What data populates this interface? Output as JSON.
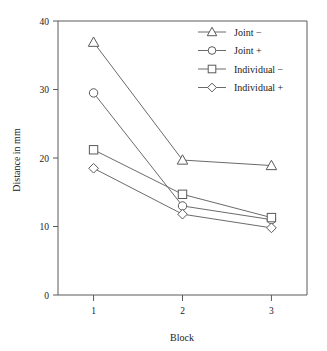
{
  "chart_data": {
    "type": "line",
    "title": "",
    "subtitle": "",
    "xlabel": "Block",
    "ylabel": "Distance in mm",
    "categories": [
      "1",
      "2",
      "3"
    ],
    "x": [
      1,
      2,
      3
    ],
    "xlim": [
      0.6,
      3.4
    ],
    "ylim": [
      0,
      40
    ],
    "yticks": [
      0,
      10,
      20,
      30,
      40
    ],
    "ytick_labels": [
      "0",
      "10",
      "20",
      "30",
      "40"
    ],
    "xticks": [
      1,
      2,
      3
    ],
    "xtick_labels": [
      "1",
      "2",
      "3"
    ],
    "grid": false,
    "legend_position": "top-right",
    "series": [
      {
        "name": "Joint −",
        "marker": "triangle",
        "values": [
          36.9,
          19.7,
          18.9
        ]
      },
      {
        "name": "Joint +",
        "marker": "circle",
        "values": [
          29.5,
          13.0,
          11.0
        ]
      },
      {
        "name": "Individual −",
        "marker": "square",
        "values": [
          21.2,
          14.7,
          11.3
        ]
      },
      {
        "name": "Individual +",
        "marker": "diamond",
        "values": [
          18.5,
          11.8,
          9.8
        ]
      }
    ],
    "annotations": []
  },
  "legend": {
    "entries": [
      {
        "label": "Joint −",
        "marker": "triangle"
      },
      {
        "label": "Joint +",
        "marker": "circle"
      },
      {
        "label": "Individual −",
        "marker": "square"
      },
      {
        "label": "Individual +",
        "marker": "diamond"
      }
    ]
  },
  "axes": {
    "y_label": "Distance in mm",
    "x_label": "Block",
    "y_ticks": [
      "40",
      "30",
      "20",
      "10",
      "0"
    ],
    "x_ticks": [
      "1",
      "2",
      "3"
    ]
  }
}
